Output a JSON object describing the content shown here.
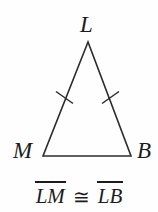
{
  "figure": {
    "type": "isosceles-triangle",
    "stroke_color": "#2b2b2b",
    "background_color": "#fefefe",
    "text_color": "#1c1c1c",
    "vertices": [
      {
        "name": "L",
        "label": "L",
        "role": "apex",
        "x": 88,
        "y": 42
      },
      {
        "name": "M",
        "label": "M",
        "role": "bottom-left",
        "x": 43,
        "y": 156
      },
      {
        "name": "B",
        "label": "B",
        "role": "bottom-right",
        "x": 131,
        "y": 156
      }
    ],
    "sides": [
      {
        "name": "LM",
        "from": "L",
        "to": "M",
        "tick_marks": 1
      },
      {
        "name": "LB",
        "from": "L",
        "to": "B",
        "tick_marks": 1
      },
      {
        "name": "MB",
        "from": "M",
        "to": "B",
        "tick_marks": 0
      }
    ],
    "tick_marks": [
      {
        "on_side": "LM",
        "x": 64,
        "y": 97
      },
      {
        "on_side": "LB",
        "x": 110,
        "y": 97
      }
    ]
  },
  "labels": {
    "apex": "L",
    "bottom_left": "M",
    "bottom_right": "B"
  },
  "statement": {
    "left_segment": "LM",
    "relation_symbol": "≅",
    "right_segment": "LB",
    "full_text": "LM ≅ LB",
    "overbar": true
  }
}
